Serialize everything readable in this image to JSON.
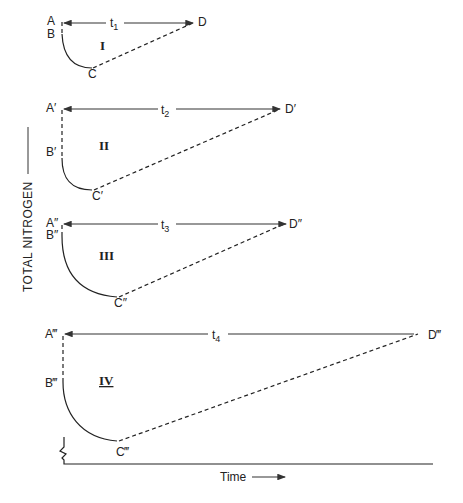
{
  "figure": {
    "y_axis_label": "TOTAL NITROGEN",
    "x_axis_label": "Time",
    "panels": [
      {
        "id": "I",
        "roman": "I",
        "points": {
          "A": "A",
          "B": "B",
          "C": "C",
          "D": "D"
        },
        "interval_label": "t",
        "interval_sub": "1"
      },
      {
        "id": "II",
        "roman": "II",
        "points": {
          "A": "A′",
          "B": "B′",
          "C": "C′",
          "D": "D′"
        },
        "interval_label": "t",
        "interval_sub": "2"
      },
      {
        "id": "III",
        "roman": "III",
        "points": {
          "A": "A″",
          "B": "B″",
          "C": "C″",
          "D": "D″"
        },
        "interval_label": "t",
        "interval_sub": "3"
      },
      {
        "id": "IV",
        "roman": "IV",
        "points": {
          "A": "A‴",
          "B": "B‴",
          "C": "C‴",
          "D": "D‴"
        },
        "interval_label": "t",
        "interval_sub": "4"
      }
    ]
  }
}
